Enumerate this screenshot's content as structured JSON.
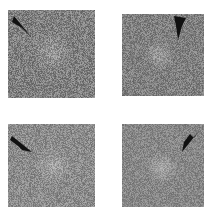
{
  "figure": {
    "background": "#ffffff",
    "panels": [
      {
        "id": "a",
        "box": [
          8,
          10,
          87,
          88
        ],
        "base_gray": 128,
        "noise_amp": 70,
        "blob": {
          "cx": 0.5,
          "cy": 0.48,
          "r": 0.22,
          "boost": 30
        },
        "arrow": {
          "tip": [
            24,
            28
          ],
          "direction": "down-right",
          "points": "6,6 24,28 14,18 4,12"
        },
        "arrow_color": "#111111"
      },
      {
        "id": "b",
        "box": [
          122,
          14,
          82,
          82
        ],
        "base_gray": 128,
        "noise_amp": 60,
        "blob": {
          "cx": 0.45,
          "cy": 0.5,
          "r": 0.2,
          "boost": 30
        },
        "arrow": {
          "tip": [
            55,
            24
          ],
          "direction": "down",
          "points": "52,2 64,4 60,12 56,26 54,12"
        },
        "arrow_color": "#111111"
      },
      {
        "id": "c",
        "box": [
          8,
          124,
          87,
          83
        ],
        "base_gray": 140,
        "noise_amp": 60,
        "blob": {
          "cx": 0.52,
          "cy": 0.5,
          "r": 0.22,
          "boost": 25
        },
        "arrow": {
          "tip": [
            24,
            28
          ],
          "direction": "down-right",
          "points": "4,12 24,28 14,26 10,22 2,16"
        },
        "arrow_color": "#111111"
      },
      {
        "id": "d",
        "box": [
          122,
          124,
          82,
          83
        ],
        "base_gray": 135,
        "noise_amp": 50,
        "blob": {
          "cx": 0.48,
          "cy": 0.52,
          "r": 0.2,
          "boost": 35
        },
        "arrow": {
          "tip": [
            60,
            28
          ],
          "direction": "down-left",
          "points": "76,8 60,28 62,18 68,10 72,14"
        },
        "arrow_color": "#111111"
      }
    ]
  }
}
